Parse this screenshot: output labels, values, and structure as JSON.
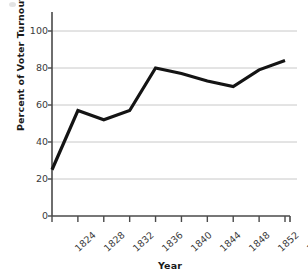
{
  "chart_data": {
    "type": "line",
    "title": "",
    "xlabel": "Year",
    "ylabel": "Percent of Voter Turnout",
    "categories": [
      "1824",
      "1828",
      "1832",
      "1836",
      "1840",
      "1844",
      "1848",
      "1852",
      "1856",
      "1860"
    ],
    "x": [
      1824,
      1828,
      1832,
      1836,
      1840,
      1844,
      1848,
      1852,
      1856,
      1860
    ],
    "values": [
      25,
      57,
      52,
      57,
      80,
      77,
      73,
      70,
      79,
      84
    ],
    "series": [
      {
        "name": "Percent of Voter Turnout",
        "values": [
          25,
          57,
          52,
          57,
          80,
          77,
          73,
          70,
          79,
          84
        ]
      }
    ],
    "ylim": [
      0,
      110
    ],
    "yticks": [
      0,
      20,
      40,
      60,
      80,
      100
    ],
    "ytick_labels": [
      "0",
      "20",
      "40",
      "60",
      "80",
      "100"
    ],
    "xlim": [
      1824,
      1860
    ],
    "grid": "horizontal",
    "legend": "none",
    "line_color": "#141414",
    "grid_color": "#c8c8c8",
    "axis_color": "#4a4a4a",
    "background_color": "#ffffff"
  },
  "axes": {
    "y_title": "Percent of Voter Turnout",
    "x_title": "Year"
  },
  "ytick_labels": [
    "100",
    "80",
    "60",
    "40",
    "20",
    "0"
  ],
  "xtick_labels": [
    "1824",
    "1828",
    "1832",
    "1836",
    "1840",
    "1844",
    "1848",
    "1852",
    "1856",
    "1860"
  ]
}
